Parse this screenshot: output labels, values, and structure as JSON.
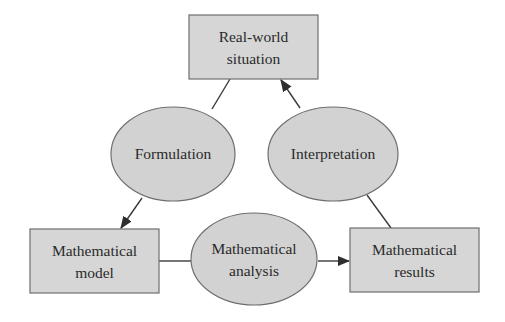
{
  "diagram": {
    "type": "cycle-flow",
    "colors": {
      "node_fill": "#d6d6d6",
      "node_stroke": "#6e6e6e",
      "edge": "#3a3a3a",
      "text": "#2a2a2a",
      "background": "#ffffff"
    },
    "boxes": {
      "real_world": {
        "line1": "Real-world",
        "line2": "situation"
      },
      "model": {
        "line1": "Mathematical",
        "line2": "model"
      },
      "results": {
        "line1": "Mathematical",
        "line2": "results"
      }
    },
    "processes": {
      "formulation": {
        "label": "Formulation"
      },
      "interpretation": {
        "label": "Interpretation"
      },
      "analysis": {
        "line1": "Mathematical",
        "line2": "analysis"
      }
    },
    "edges": [
      {
        "from": "Real-world situation",
        "via": "Formulation",
        "to": "Mathematical model"
      },
      {
        "from": "Mathematical model",
        "via": "Mathematical analysis",
        "to": "Mathematical results"
      },
      {
        "from": "Mathematical results",
        "via": "Interpretation",
        "to": "Real-world situation"
      }
    ]
  }
}
